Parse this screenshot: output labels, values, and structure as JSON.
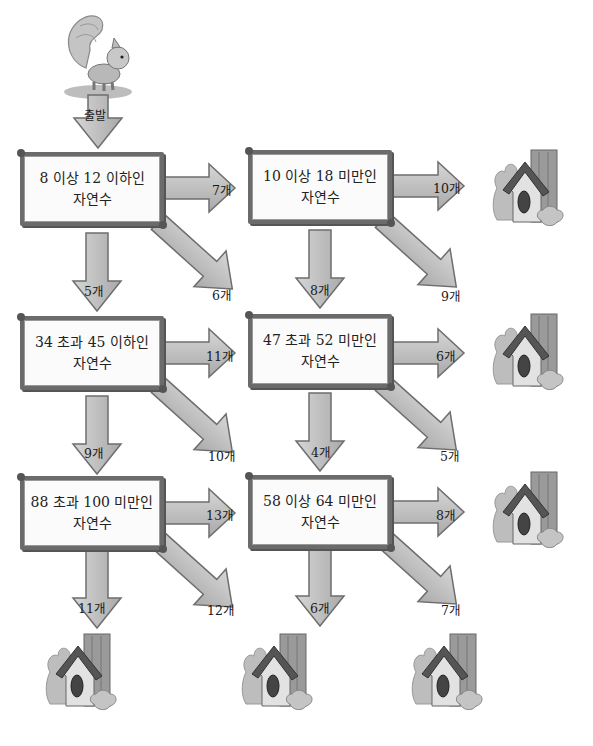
{
  "start": {
    "character": "squirrel",
    "label": "출발"
  },
  "signs": [
    {
      "id": "r1c1",
      "line1": "8 이상 12 이하인",
      "line2": "자연수",
      "arrows": {
        "right": "7개",
        "down": "5개",
        "diag": "6개"
      }
    },
    {
      "id": "r1c2",
      "line1": "10 이상 18 미만인",
      "line2": "자연수",
      "arrows": {
        "right": "10개",
        "down": "8개",
        "diag": "9개"
      }
    },
    {
      "id": "r2c1",
      "line1": "34 초과 45 이하인",
      "line2": "자연수",
      "arrows": {
        "right": "11개",
        "down": "9개",
        "diag": "10개"
      }
    },
    {
      "id": "r2c2",
      "line1": "47 초과 52 미만인",
      "line2": "자연수",
      "arrows": {
        "right": "6개",
        "down": "4개",
        "diag": "5개"
      }
    },
    {
      "id": "r3c1",
      "line1": "88 초과 100 미만인",
      "line2": "자연수",
      "arrows": {
        "right": "13개",
        "down": "11개",
        "diag": "12개"
      }
    },
    {
      "id": "r3c2",
      "line1": "58 이상 64 미만인",
      "line2": "자연수",
      "arrows": {
        "right": "8개",
        "down": "6개",
        "diag": "7개"
      }
    }
  ],
  "houses": [
    "birdhouse",
    "birdhouse",
    "birdhouse",
    "birdhouse",
    "birdhouse",
    "birdhouse"
  ],
  "colors": {
    "arrow_fill": "#c9c9c9",
    "arrow_stroke": "#6e6e6e",
    "sign_border": "#6b6b6b",
    "house_roof": "#555555",
    "house_body": "#d8d8d8"
  }
}
